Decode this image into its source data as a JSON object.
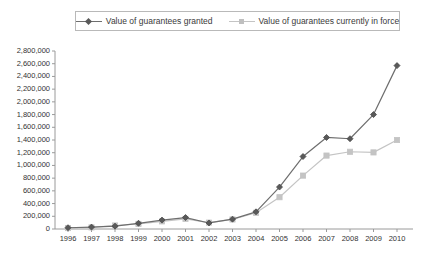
{
  "legend": {
    "position": "top",
    "entries": [
      {
        "label": "Value of guarantees granted",
        "marker": "diamond-marker-icon",
        "color": "#6e6e6e"
      },
      {
        "label": "Value of guarantees currently in force",
        "marker": "square-marker-icon",
        "color": "#c4c4c4"
      }
    ]
  },
  "chart_data": {
    "type": "line",
    "title": "",
    "xlabel": "",
    "ylabel": "",
    "grid": false,
    "legend_position": "top",
    "x": [
      1996,
      1997,
      1998,
      1999,
      2000,
      2001,
      2002,
      2003,
      2004,
      2005,
      2006,
      2007,
      2008,
      2009,
      2010
    ],
    "categories": [
      "1996",
      "1997",
      "1998",
      "1999",
      "2000",
      "2001",
      "2002",
      "2003",
      "2004",
      "2005",
      "2006",
      "2007",
      "2008",
      "2009",
      "2010"
    ],
    "xlim": [
      1996,
      2010
    ],
    "ylim": [
      0,
      2800000
    ],
    "yticks": [
      0,
      200000,
      400000,
      600000,
      800000,
      1000000,
      1200000,
      1400000,
      1600000,
      1800000,
      2000000,
      2200000,
      2400000,
      2600000,
      2800000
    ],
    "ytick_labels": [
      "0",
      "200,000",
      "400,000",
      "600,000",
      "800,000",
      "1,000,000",
      "1,200,000",
      "1,400,000",
      "1,600,000",
      "1,800,000",
      "2,000,000",
      "2,200,000",
      "2,400,000",
      "2,600,000",
      "2,800,000"
    ],
    "series": [
      {
        "name": "Value of guarantees granted",
        "color": "#6e6e6e",
        "marker": "diamond",
        "values": [
          20000,
          30000,
          45000,
          90000,
          140000,
          180000,
          95000,
          155000,
          270000,
          660000,
          1140000,
          1440000,
          1420000,
          1800000,
          2570000
        ]
      },
      {
        "name": "Value of guarantees currently in force",
        "color": "#c4c4c4",
        "marker": "square",
        "values": [
          15000,
          25000,
          55000,
          80000,
          120000,
          160000,
          100000,
          150000,
          255000,
          500000,
          840000,
          1155000,
          1215000,
          1205000,
          1400000
        ]
      }
    ]
  }
}
